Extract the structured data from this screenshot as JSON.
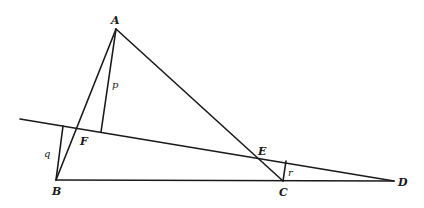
{
  "diagram": {
    "type": "geometry-triangle-transversal",
    "points": {
      "A": {
        "label": "A",
        "x": 116,
        "y": 29
      },
      "B": {
        "label": "B",
        "x": 56,
        "y": 180
      },
      "C": {
        "label": "C",
        "x": 283,
        "y": 181
      },
      "D": {
        "label": "D",
        "x": 394,
        "y": 181
      },
      "E": {
        "label": "E",
        "x": 260,
        "y": 157
      },
      "F": {
        "label": "F",
        "x": 76,
        "y": 129
      }
    },
    "segments": [
      {
        "name": "AB",
        "from": "A",
        "to": "B"
      },
      {
        "name": "AC",
        "from": "A",
        "to": "C"
      },
      {
        "name": "BD",
        "from": "B",
        "to": "D"
      },
      {
        "name": "transversal",
        "from": "start",
        "to": "D"
      }
    ],
    "perpendiculars": [
      {
        "label": "p",
        "from": "A",
        "foot_x": 101,
        "foot_y": 132
      },
      {
        "label": "q",
        "from": "B",
        "foot_x": 63,
        "foot_y": 126
      },
      {
        "label": "r",
        "from": "C",
        "foot_x": 286,
        "foot_y": 161
      }
    ],
    "labels": {
      "A": "A",
      "B": "B",
      "C": "C",
      "D": "D",
      "E": "E",
      "F": "F",
      "p": "p",
      "q": "q",
      "r": "r"
    }
  }
}
